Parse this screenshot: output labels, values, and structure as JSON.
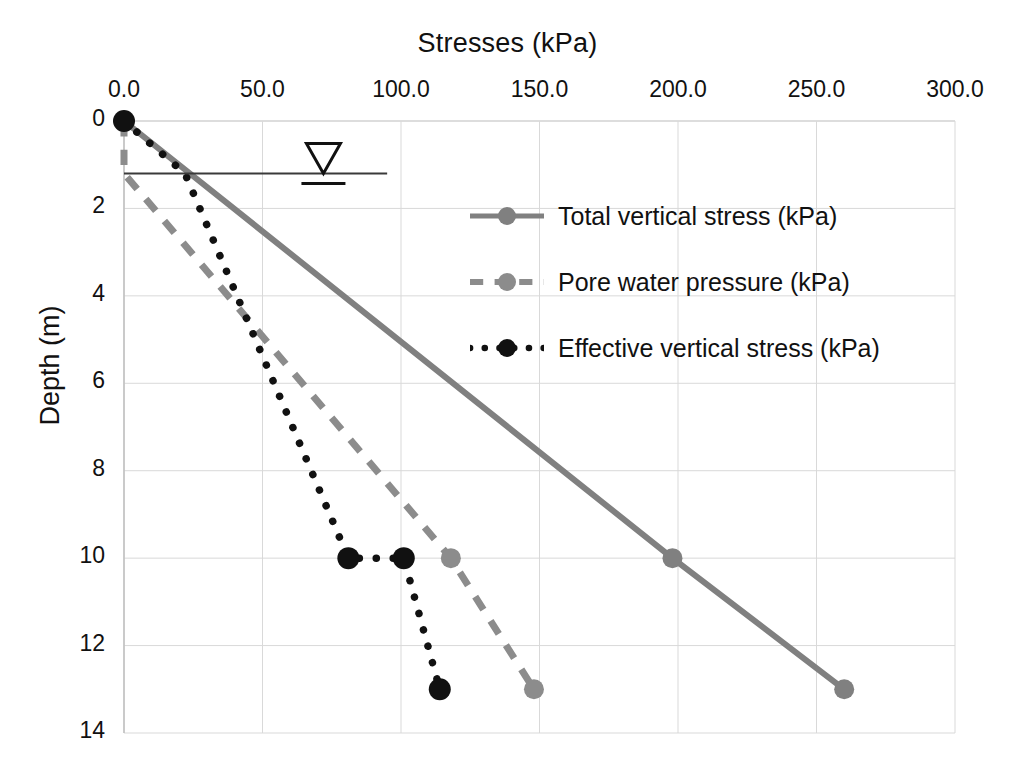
{
  "chart_data": {
    "type": "line",
    "title": "Stresses (kPa)",
    "xlabel": "Stresses (kPa)",
    "ylabel": "Depth (m)",
    "xlim": [
      0,
      300
    ],
    "ylim": [
      0,
      14
    ],
    "y_inverted": true,
    "grid": true,
    "legend_position": "inside-upper-right",
    "x_ticks": [
      "0.0",
      "50.0",
      "100.0",
      "150.0",
      "200.0",
      "250.0",
      "300.0"
    ],
    "x_tick_values": [
      0,
      50,
      100,
      150,
      200,
      250,
      300
    ],
    "y_ticks": [
      "0",
      "2",
      "4",
      "6",
      "8",
      "10",
      "12",
      "14"
    ],
    "y_tick_values": [
      0,
      2,
      4,
      6,
      8,
      10,
      12,
      14
    ],
    "series": [
      {
        "name": "Total vertical stress (kPa)",
        "color": "#808080",
        "style": "solid",
        "marker": "circle",
        "points": [
          {
            "depth": 0,
            "stress": 0
          },
          {
            "depth": 10,
            "stress": 198
          },
          {
            "depth": 13,
            "stress": 260
          }
        ]
      },
      {
        "name": "Pore water pressure (kPa)",
        "color": "#8c8c8c",
        "style": "dashed",
        "marker": "circle",
        "points": [
          {
            "depth": 0,
            "stress": 0
          },
          {
            "depth": 1.2,
            "stress": 0
          },
          {
            "depth": 10,
            "stress": 118
          },
          {
            "depth": 13,
            "stress": 148
          }
        ]
      },
      {
        "name": "Effective vertical stress (kPa)",
        "color": "#111111",
        "style": "dotted",
        "marker": "circle",
        "points": [
          {
            "depth": 0,
            "stress": 0
          },
          {
            "depth": 1.2,
            "stress": 22
          },
          {
            "depth": 10,
            "stress": 81
          },
          {
            "depth": 10,
            "stress": 101
          },
          {
            "depth": 13,
            "stress": 114
          }
        ]
      }
    ],
    "annotations": [
      {
        "name": "water-table",
        "type": "water-table-line",
        "depth": 1.2,
        "x_start": 0,
        "x_end": 95,
        "symbol_x": 72,
        "symbol": "inverted-triangle"
      }
    ]
  },
  "legend": {
    "items": [
      {
        "label": "Total vertical stress (kPa)",
        "color": "#808080",
        "style": "solid"
      },
      {
        "label": "Pore water pressure (kPa)",
        "color": "#8c8c8c",
        "style": "dashed"
      },
      {
        "label": "Effective vertical stress (kPa)",
        "color": "#111111",
        "style": "dotted"
      }
    ]
  }
}
